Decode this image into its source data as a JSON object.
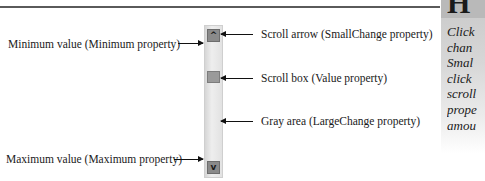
{
  "diagram": {
    "left_labels": {
      "minimum": "Minimum value (Minimum property)",
      "maximum": "Maximum value (Maximum property)"
    },
    "right_labels": {
      "scroll_arrow": "Scroll arrow (SmallChange property)",
      "scroll_box": "Scroll box (Value property)",
      "gray_area": "Gray area (LargeChange property)"
    },
    "scrollbar": {
      "up_icon": "^",
      "down_icon": "v",
      "colors": {
        "track": "#e6e6e6",
        "button": "#8a8a8a",
        "thumb": "#9a9a9a"
      }
    }
  },
  "sidebar": {
    "heading_glyph": "H",
    "lines": [
      "Click",
      "chan",
      "Smal",
      "click",
      "scroll",
      "prope",
      "amou"
    ],
    "colors": {
      "background": "#d4d4d4"
    }
  }
}
